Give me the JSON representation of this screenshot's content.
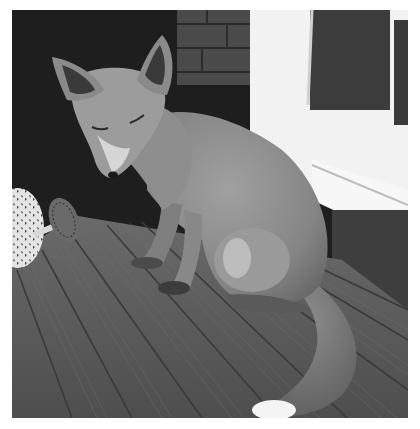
{
  "image": {
    "alt": "Black and white photo of a young fox sitting on wooden decking next to a window and a brick wall, with a decorative watering can on the left",
    "palette": {
      "background": "#ffffff",
      "dark_wall": "#1e1e1e",
      "brick": "#4a4a4a",
      "window_frame": "#f2f2f2",
      "glass": "#3c3c3c",
      "fox_fur": "#8a8a8a",
      "fox_light": "#c8c8c8",
      "decking": "#5e5e5e",
      "decking_groove": "#3a3a3a"
    },
    "subjects": [
      "fox",
      "watering-can",
      "window",
      "brick-wall",
      "wooden-decking"
    ]
  }
}
